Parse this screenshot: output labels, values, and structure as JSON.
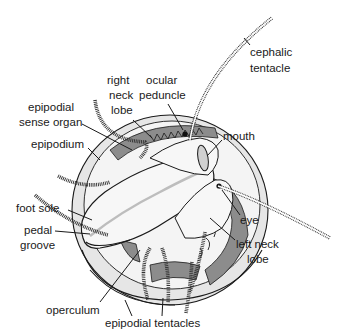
{
  "diagram": {
    "type": "anatomical-illustration",
    "labels": [
      {
        "id": "cephalic-tentacle",
        "lines": [
          "cephalic",
          "tentacle"
        ]
      },
      {
        "id": "right-neck-lobe",
        "lines": [
          "right",
          "neck",
          "lobe"
        ]
      },
      {
        "id": "ocular-peduncle",
        "lines": [
          "ocular",
          "peduncle"
        ]
      },
      {
        "id": "epipodial-sense-organ",
        "lines": [
          "epipodial",
          "sense organ"
        ]
      },
      {
        "id": "epipodium",
        "lines": [
          "epipodium"
        ]
      },
      {
        "id": "mouth",
        "lines": [
          "mouth"
        ]
      },
      {
        "id": "eye",
        "lines": [
          "eye"
        ]
      },
      {
        "id": "left-neck-lobe",
        "lines": [
          "left neck",
          "lobe"
        ]
      },
      {
        "id": "foot-sole",
        "lines": [
          "foot sole"
        ]
      },
      {
        "id": "pedal-groove",
        "lines": [
          "pedal",
          "groove"
        ]
      },
      {
        "id": "operculum",
        "lines": [
          "operculum"
        ]
      },
      {
        "id": "epipodial-tentacles",
        "lines": [
          "epipodial tentacles"
        ]
      }
    ],
    "colors": {
      "outline": "#1a1a1a",
      "body_light": "#f2f2f2",
      "body_mid": "#d9d9d9",
      "body_dark": "#8c8c8c",
      "background": "#ffffff"
    }
  }
}
